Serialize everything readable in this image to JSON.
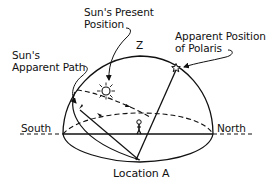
{
  "diagram": {
    "title": "Location A",
    "labels": {
      "sun_present_position_line1": "Sun's Present",
      "sun_present_position_line2": "Position",
      "sun_apparent_path_line1": "Sun's",
      "sun_apparent_path_line2": "Apparent Path",
      "polaris_line1": "Apparent Position",
      "polaris_line2": "of Polaris",
      "zenith": "Z",
      "south": "South",
      "north": "North",
      "location": "Location A"
    },
    "icons": {
      "sun": "sun-icon",
      "star": "star-icon",
      "observer": "stick-figure-icon"
    },
    "colors": {
      "ink": "#111111",
      "background": "#ffffff"
    }
  }
}
